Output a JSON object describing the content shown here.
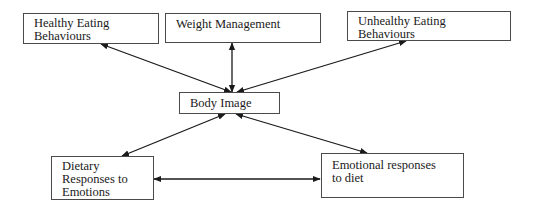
{
  "diagram": {
    "nodes": {
      "healthy": {
        "label": "Healthy Eating\nBehaviours"
      },
      "weight": {
        "label": "Weight Management"
      },
      "unhealthy": {
        "label": "Unhealthy Eating\nBehaviours"
      },
      "body_image": {
        "label": "Body Image"
      },
      "dietary": {
        "label": "Dietary\nResponses to\nEmotions"
      },
      "emotional": {
        "label": "Emotional responses\nto diet"
      }
    },
    "edges": [
      {
        "from": "body_image",
        "to": "healthy",
        "type": "bidirectional"
      },
      {
        "from": "body_image",
        "to": "weight",
        "type": "bidirectional"
      },
      {
        "from": "body_image",
        "to": "unhealthy",
        "type": "bidirectional"
      },
      {
        "from": "body_image",
        "to": "dietary",
        "type": "bidirectional"
      },
      {
        "from": "body_image",
        "to": "emotional",
        "type": "bidirectional"
      },
      {
        "from": "dietary",
        "to": "emotional",
        "type": "bidirectional"
      }
    ],
    "colors": {
      "line": "#1a1a1a",
      "border": "#4a4a4a",
      "background": "#ffffff"
    }
  }
}
